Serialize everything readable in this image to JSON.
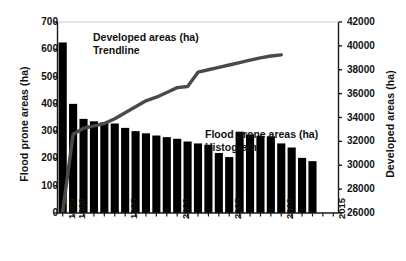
{
  "chart_data": {
    "type": "bar",
    "title": "",
    "xlabel": "",
    "ylabel": "Flood prone areas (ha)",
    "y2label": "Developed areas (ha)",
    "xlim": [
      1988.5,
      2015.5
    ],
    "ylim": [
      0,
      700
    ],
    "y2lim": [
      26000,
      42000
    ],
    "grid": false,
    "legend_position": "inside-annotations",
    "x_ticks": [
      1989,
      1990,
      1995,
      2000,
      2005,
      2010,
      2015
    ],
    "x_tick_labels": [
      "1989",
      "1990",
      "1995",
      "2000",
      "2005",
      "2010",
      "2015"
    ],
    "y_ticks": [
      0,
      100,
      200,
      300,
      400,
      500,
      600,
      700
    ],
    "y_tick_labels": [
      "0",
      "100",
      "200",
      "300",
      "400",
      "500",
      "600",
      "700"
    ],
    "y2_ticks": [
      26000,
      28000,
      30000,
      32000,
      34000,
      36000,
      38000,
      40000,
      42000
    ],
    "y2_tick_labels": [
      "26000",
      "28000",
      "30000",
      "32000",
      "34000",
      "36000",
      "38000",
      "40000",
      "42000"
    ],
    "annotations": [
      {
        "name": "trendline-label",
        "line1": "Developed  areas  (ha)",
        "line2": "Trendline"
      },
      {
        "name": "histogram-label",
        "line1": "Flood prone areas (ha)",
        "line2": "Histogram"
      }
    ],
    "series": [
      {
        "name": "Flood prone areas (ha)",
        "type": "bar",
        "axis": "left",
        "color": "#000000",
        "categories": [
          1989,
          1990,
          1991,
          1992,
          1993,
          1994,
          1995,
          1996,
          1997,
          1998,
          1999,
          2000,
          2001,
          2002,
          2003,
          2004,
          2005,
          2006,
          2007,
          2008,
          2009,
          2010,
          2011,
          2012,
          2013
        ],
        "values": [
          625,
          400,
          345,
          336,
          332,
          328,
          312,
          300,
          292,
          284,
          278,
          272,
          262,
          255,
          250,
          220,
          205,
          298,
          288,
          283,
          281,
          255,
          240,
          202,
          190
        ]
      },
      {
        "name": "Developed areas (ha) Trendline",
        "type": "line",
        "axis": "right",
        "color": "#4a4a4a",
        "x": [
          1989,
          1990,
          1991,
          1992,
          1993,
          1994,
          1995,
          1996,
          1997,
          1998,
          1999,
          2000,
          2001,
          2002,
          2003,
          2004,
          2005,
          2006,
          2007,
          2008,
          2009,
          2010
        ],
        "values": [
          26100,
          32600,
          33100,
          33300,
          33500,
          33900,
          34400,
          34900,
          35400,
          35700,
          36100,
          36500,
          36600,
          37800,
          38000,
          38200,
          38400,
          38600,
          38800,
          39000,
          39150,
          39250
        ]
      }
    ]
  }
}
